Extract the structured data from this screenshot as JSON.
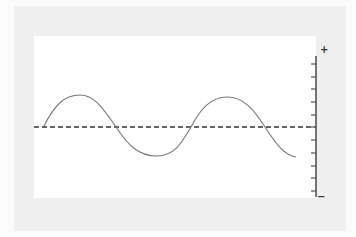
{
  "diagram": {
    "type": "waveform",
    "scale": {
      "top_label": "+",
      "bottom_label": "−",
      "tick_count": 11
    },
    "colors": {
      "background": "#fbfbfb",
      "frame": "#efefef",
      "panel": "#ffffff",
      "wave": "#777777",
      "baseline": "#333333",
      "axis": "#555555"
    }
  }
}
